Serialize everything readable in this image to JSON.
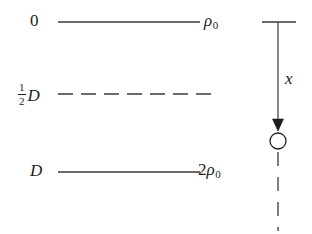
{
  "figure": {
    "background_color": "#ffffff",
    "line_color": "#3a3a3a",
    "text_color": "#1c1c1c"
  },
  "levels": [
    {
      "id": "top",
      "style": "solid",
      "y": 22,
      "x_start": 58,
      "x_end": 200,
      "left_label": "0",
      "right_label_base": "ρ",
      "right_label_sub": "0",
      "right_label_coef": ""
    },
    {
      "id": "middle",
      "style": "dashed",
      "y": 94,
      "x_start": 58,
      "x_end": 211,
      "left_label_num": "1",
      "left_label_den": "2",
      "left_label_var": "D",
      "right_label_base": "",
      "right_label_sub": "",
      "right_label_coef": ""
    },
    {
      "id": "bottom",
      "style": "solid",
      "y": 172,
      "x_start": 58,
      "x_end": 200,
      "left_label": "D",
      "right_label_base": "ρ",
      "right_label_sub": "0",
      "right_label_coef": "2"
    }
  ],
  "axis": {
    "label": "x",
    "direction": "downward",
    "cap_y": 22,
    "cap_x_start": 262,
    "cap_x_end": 296,
    "line_x": 278,
    "arrow_tip_y": 130,
    "marker_shape": "circle",
    "marker_center_y": 141,
    "marker_radius": 8,
    "dashed_tail_start_y": 152,
    "dashed_tail_end_y": 231
  }
}
